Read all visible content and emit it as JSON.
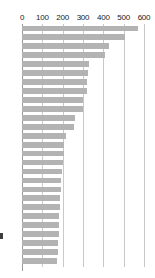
{
  "chart_data": {
    "type": "bar",
    "orientation": "horizontal",
    "title": "",
    "subtitle": "",
    "xlabel": "",
    "ylabel": "",
    "xlim": [
      0,
      600
    ],
    "ylim": null,
    "grid": true,
    "grid_axis": "x",
    "legend": false,
    "legend_position": "none",
    "axis_position": "top",
    "bar_color": "#b3b3b3",
    "gridline_color": "#c9c9c9",
    "axis_color": "#9a9a9a",
    "tick_label_color": "#1a1a1a",
    "x_ticks": [
      0,
      100,
      200,
      300,
      400,
      500,
      600
    ],
    "x_tick_labels": [
      "0",
      "100",
      "200",
      "300",
      "400",
      "500",
      "600"
    ],
    "categories": [
      "",
      "",
      "",
      "",
      "",
      "",
      "",
      "",
      "",
      "",
      "",
      "",
      "",
      "",
      "",
      "",
      "",
      "",
      "",
      "",
      "",
      "",
      "",
      "",
      "",
      "",
      ""
    ],
    "values": [
      570,
      505,
      430,
      408,
      330,
      325,
      322,
      318,
      300,
      298,
      262,
      258,
      215,
      208,
      205,
      200,
      196,
      192,
      190,
      188,
      186,
      184,
      182,
      180,
      178,
      176,
      174
    ],
    "values_label_visible": false,
    "bar_count": 27
  },
  "marker": {
    "name": "left-edge-marker",
    "color": "#3d3d3d"
  }
}
